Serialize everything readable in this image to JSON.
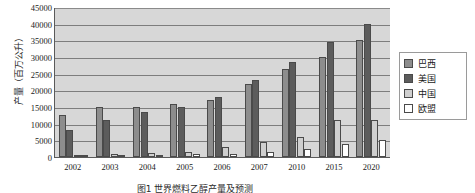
{
  "chart_data": {
    "type": "bar",
    "title": "",
    "xlabel": "",
    "ylabel": "产量（百万公升）",
    "ylim": [
      0,
      45000
    ],
    "ytick_step": 5000,
    "yticks": [
      45000,
      40000,
      35000,
      30000,
      25000,
      20000,
      15000,
      10000,
      5000,
      0
    ],
    "ytick_labels": [
      "45000",
      "40000",
      "35000",
      "30000",
      "25000",
      "20000",
      "15000",
      "10000",
      "5000",
      "0"
    ],
    "categories": [
      "2002",
      "2003",
      "2004",
      "2005",
      "2006",
      "2007",
      "2010",
      "2015",
      "2020"
    ],
    "grid": true,
    "legend_position": "right",
    "plot_background": "#d7d7d7",
    "series": [
      {
        "name": "巴西",
        "color": "#8d8d8d",
        "values": [
          12500,
          15000,
          15000,
          16000,
          17000,
          22000,
          26500,
          30000,
          35000
        ]
      },
      {
        "name": "美国",
        "color": "#5c5c5c",
        "values": [
          8000,
          11000,
          13500,
          15000,
          18000,
          23000,
          28500,
          34500,
          40000
        ]
      },
      {
        "name": "中国",
        "color": "#cfcfcf",
        "values": [
          500,
          1000,
          1200,
          1500,
          3000,
          4500,
          6000,
          11000,
          11000
        ]
      },
      {
        "name": "欧盟",
        "color": "#ffffff",
        "values": [
          300,
          500,
          600,
          800,
          1000,
          1500,
          2500,
          4000,
          5000
        ]
      }
    ]
  },
  "caption": {
    "text": "图1 世界燃料乙醇产量及预测"
  }
}
